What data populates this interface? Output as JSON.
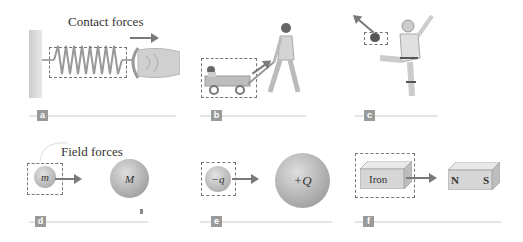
{
  "headings": {
    "contact": "Contact forces",
    "field": "Field forces"
  },
  "panels": [
    {
      "id": "a",
      "label": "a",
      "description": "Spring pulled by hand"
    },
    {
      "id": "b",
      "label": "b",
      "description": "Person pulling wagon with child"
    },
    {
      "id": "c",
      "label": "c",
      "description": "Football player kicking ball"
    },
    {
      "id": "d",
      "label": "d",
      "small_mass": "m",
      "large_mass": "M"
    },
    {
      "id": "e",
      "label": "e",
      "small_charge": "−q",
      "large_charge": "+Q"
    },
    {
      "id": "f",
      "label": "f",
      "iron": "Iron",
      "north": "N",
      "south": "S"
    }
  ],
  "colors": {
    "arrow": "#7a7a7a",
    "dashed_box": "#777777",
    "badge": "#9a9a9a",
    "baseline": "#e4e4e4"
  }
}
